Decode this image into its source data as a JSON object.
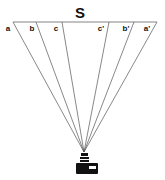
{
  "diagram": {
    "title": "S",
    "labels": {
      "a": "a",
      "b": "b",
      "c": "c",
      "c_prime": "c'",
      "b_prime": "b'",
      "a_prime": "a'"
    },
    "colors": {
      "line": "#444444",
      "camera": "#111111",
      "background": "#ffffff"
    }
  }
}
